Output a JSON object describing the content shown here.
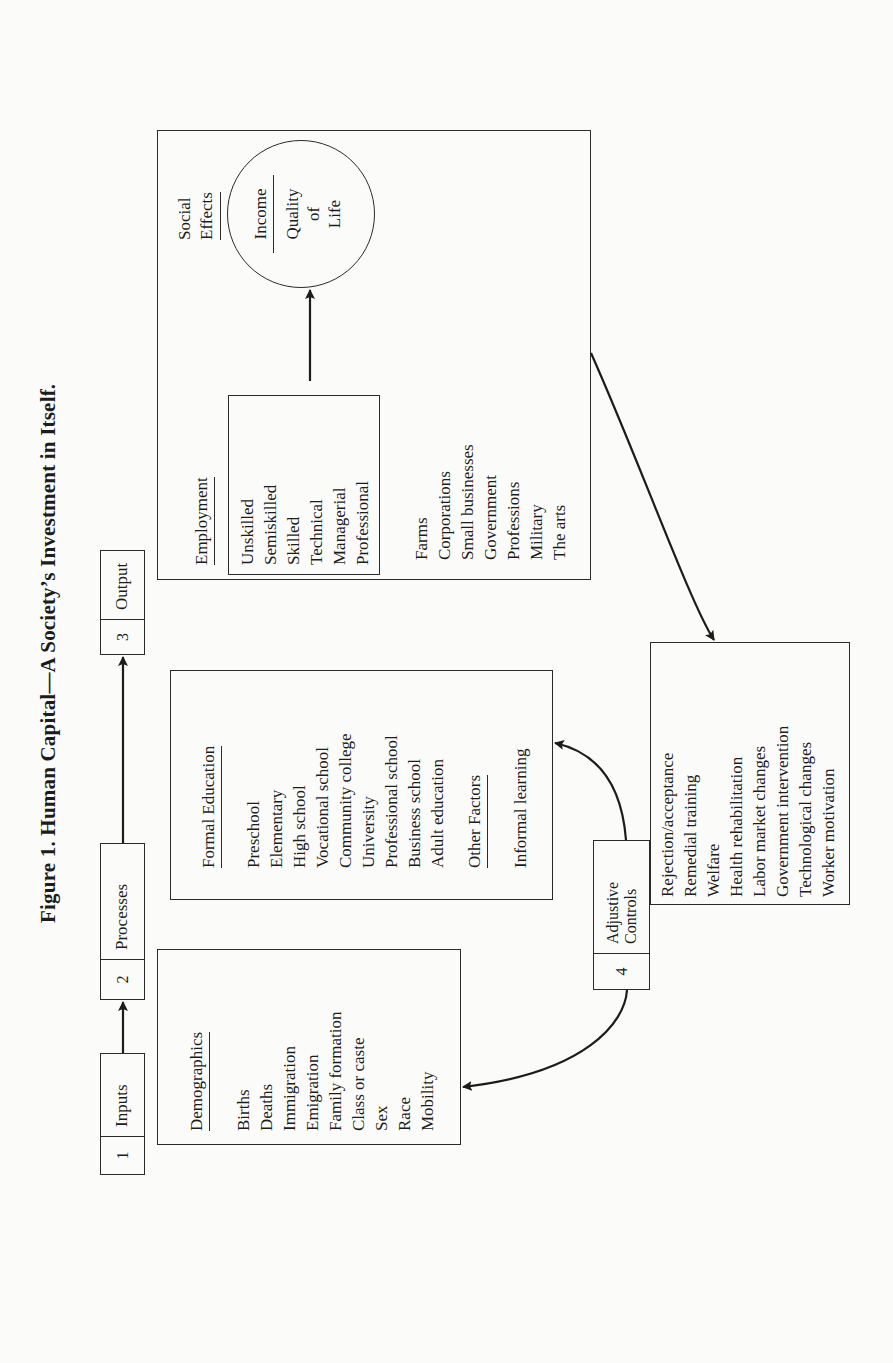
{
  "figure": {
    "title": "Figure 1. Human Capital—A Society’s Investment in Itself."
  },
  "stages": [
    {
      "number": "1",
      "label": "Inputs"
    },
    {
      "number": "2",
      "label": "Processes"
    },
    {
      "number": "3",
      "label": "Output"
    },
    {
      "number": "4",
      "label_line1": "Adjustive",
      "label_line2": "Controls"
    }
  ],
  "inputs": {
    "heading": "Demographics",
    "items": [
      "Births",
      "Deaths",
      "Immigration",
      "Emigration",
      "Family formation",
      "Class or caste",
      "Sex",
      "Race",
      "Mobility"
    ]
  },
  "processes": {
    "heading": "Formal Education",
    "items": [
      "Preschool",
      "Elementary",
      "High school",
      "Vocational school",
      "Community college",
      "University",
      "Professional school",
      "Business school",
      "Adult education"
    ],
    "other_heading": "Other Factors",
    "other_items": [
      "Informal learning"
    ]
  },
  "output": {
    "employment_heading": "Employment",
    "employment_levels": [
      "Unskilled",
      "Semiskilled",
      "Skilled",
      "Technical",
      "Managerial",
      "Professional"
    ],
    "sectors": [
      "Farms",
      "Corporations",
      "Small businesses",
      "Government",
      "Professions",
      "Military",
      "The arts"
    ],
    "social_effects_line1": "Social",
    "social_effects_line2": "Effects",
    "circle": {
      "top": "Income",
      "bottom_line1": "Quality",
      "bottom_line2": "of",
      "bottom_line3": "Life"
    }
  },
  "adjustive_controls": {
    "items": [
      "Rejection/acceptance",
      "Remedial training",
      "Welfare",
      "Health rehabilitation",
      "Labor market changes",
      "Government intervention",
      "Technological changes",
      "Worker motivation"
    ]
  },
  "colors": {
    "ink": "#1c1c1c",
    "paper": "#fbfbf9"
  }
}
